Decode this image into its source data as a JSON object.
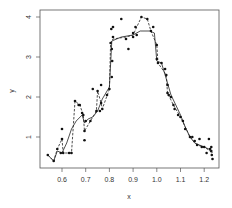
{
  "chart_data": {
    "type": "scatter",
    "title": "",
    "xlabel": "x",
    "ylabel": "y",
    "xlim": [
      0.53,
      1.24
    ],
    "ylim": [
      0.28,
      4.1
    ],
    "grid": false,
    "legend": null,
    "x_ticks": [
      "0.6",
      "0.7",
      "0.8",
      "0.9",
      "1.0",
      "1.1",
      "1.2"
    ],
    "y_ticks": [
      "1",
      "2",
      "3",
      "4"
    ],
    "points": [
      [
        0.54,
        0.55
      ],
      [
        0.565,
        0.4
      ],
      [
        0.58,
        0.7
      ],
      [
        0.595,
        0.6
      ],
      [
        0.6,
        0.95
      ],
      [
        0.6,
        1.2
      ],
      [
        0.605,
        0.6
      ],
      [
        0.63,
        0.6
      ],
      [
        0.64,
        0.6
      ],
      [
        0.655,
        1.9
      ],
      [
        0.67,
        1.8
      ],
      [
        0.675,
        1.8
      ],
      [
        0.685,
        1.6
      ],
      [
        0.69,
        1.55
      ],
      [
        0.695,
        1.15
      ],
      [
        0.695,
        0.92
      ],
      [
        0.7,
        1.4
      ],
      [
        0.72,
        1.4
      ],
      [
        0.73,
        2.2
      ],
      [
        0.745,
        1.65
      ],
      [
        0.75,
        2.15
      ],
      [
        0.76,
        1.65
      ],
      [
        0.765,
        2.3
      ],
      [
        0.765,
        1.85
      ],
      [
        0.77,
        1.7
      ],
      [
        0.79,
        2.05
      ],
      [
        0.8,
        2.2
      ],
      [
        0.805,
        3.35
      ],
      [
        0.808,
        3.7
      ],
      [
        0.81,
        3.2
      ],
      [
        0.81,
        2.5
      ],
      [
        0.812,
        2.9
      ],
      [
        0.815,
        3.75
      ],
      [
        0.815,
        3.5
      ],
      [
        0.85,
        3.95
      ],
      [
        0.87,
        3.45
      ],
      [
        0.88,
        3.2
      ],
      [
        0.9,
        3.6
      ],
      [
        0.9,
        3.5
      ],
      [
        0.91,
        3.75
      ],
      [
        0.915,
        3.55
      ],
      [
        0.935,
        4.0
      ],
      [
        0.96,
        3.95
      ],
      [
        0.975,
        3.65
      ],
      [
        0.985,
        3.75
      ],
      [
        1.0,
        3.3
      ],
      [
        1.0,
        2.95
      ],
      [
        1.005,
        2.85
      ],
      [
        1.02,
        2.85
      ],
      [
        1.035,
        2.7
      ],
      [
        1.04,
        2.55
      ],
      [
        1.045,
        2.3
      ],
      [
        1.045,
        2.1
      ],
      [
        1.05,
        2.05
      ],
      [
        1.06,
        2.0
      ],
      [
        1.07,
        1.8
      ],
      [
        1.075,
        1.7
      ],
      [
        1.09,
        1.55
      ],
      [
        1.1,
        1.5
      ],
      [
        1.11,
        1.4
      ],
      [
        1.12,
        1.2
      ],
      [
        1.14,
        1.0
      ],
      [
        1.15,
        1.0
      ],
      [
        1.16,
        0.9
      ],
      [
        1.17,
        0.8
      ],
      [
        1.18,
        0.95
      ],
      [
        1.19,
        0.75
      ],
      [
        1.2,
        0.75
      ],
      [
        1.21,
        0.6
      ],
      [
        1.22,
        0.95
      ],
      [
        1.225,
        0.7
      ],
      [
        1.23,
        0.75
      ],
      [
        1.23,
        0.65
      ],
      [
        1.232,
        0.55
      ],
      [
        1.235,
        0.45
      ]
    ],
    "series": [
      {
        "name": "solid-smooth",
        "style": "solid",
        "x": [
          0.54,
          0.565,
          0.58,
          0.6,
          0.62,
          0.64,
          0.66,
          0.685,
          0.695,
          0.71,
          0.73,
          0.75,
          0.77,
          0.8,
          0.81,
          0.85,
          0.9,
          0.93,
          0.97,
          0.99,
          1.0,
          1.02,
          1.04,
          1.06,
          1.08,
          1.1,
          1.12,
          1.14,
          1.16,
          1.18,
          1.2,
          1.22,
          1.235
        ],
        "y": [
          0.55,
          0.4,
          0.65,
          0.6,
          0.85,
          1.2,
          1.4,
          1.55,
          1.35,
          1.45,
          1.5,
          1.65,
          1.95,
          2.25,
          3.4,
          3.5,
          3.55,
          3.65,
          3.65,
          3.6,
          2.9,
          2.85,
          2.45,
          2.05,
          1.8,
          1.55,
          1.25,
          1.0,
          0.85,
          0.8,
          0.75,
          0.7,
          0.6
        ]
      },
      {
        "name": "dashed-step",
        "style": "dashed",
        "x": [
          0.54,
          0.565,
          0.58,
          0.6,
          0.605,
          0.64,
          0.655,
          0.675,
          0.69,
          0.695,
          0.72,
          0.745,
          0.75,
          0.765,
          0.77,
          0.8,
          0.805,
          0.815,
          0.87,
          0.9,
          0.935,
          0.96,
          0.975,
          1.0,
          1.005,
          1.04,
          1.045,
          1.07,
          1.1,
          1.14,
          1.17,
          1.2,
          1.225,
          1.235
        ],
        "y": [
          0.55,
          0.4,
          0.7,
          0.95,
          0.6,
          0.6,
          1.9,
          1.8,
          1.55,
          1.15,
          1.4,
          1.65,
          2.15,
          1.85,
          1.7,
          2.2,
          3.35,
          3.45,
          3.5,
          3.55,
          4.0,
          3.95,
          3.65,
          3.3,
          2.85,
          2.55,
          2.1,
          1.8,
          1.5,
          1.0,
          0.8,
          0.75,
          0.65,
          0.55
        ]
      }
    ]
  }
}
